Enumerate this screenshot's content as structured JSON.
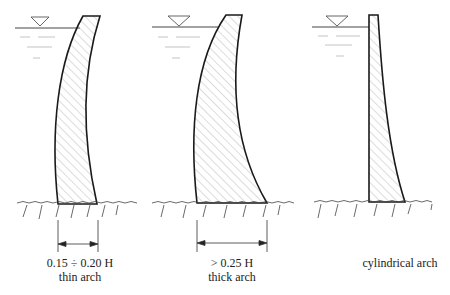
{
  "diagram": {
    "panels": [
      {
        "id": "thin",
        "dimension": "0.15 ÷ 0.20 H",
        "label": "thin arch"
      },
      {
        "id": "thick",
        "dimension": "> 0.25 H",
        "label": "thick arch"
      },
      {
        "id": "cylindrical",
        "dimension": "",
        "label": "cylindrical arch"
      }
    ],
    "colors": {
      "outline": "#1a1a1a",
      "hatch": "#9a9a9a",
      "water": "#555555",
      "ground": "#444444"
    }
  }
}
